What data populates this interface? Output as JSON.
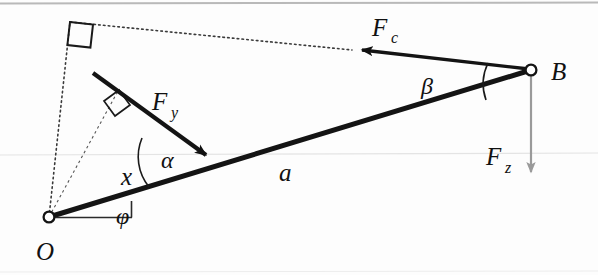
{
  "figure": {
    "background_color": "#fdfdfd",
    "stroke_color": "#111111",
    "gray_color": "#8c8c8c",
    "scan_line_color": "#bcbcbc"
  },
  "points": {
    "origin": {
      "label": "O",
      "x": 49,
      "y": 217
    },
    "end": {
      "label": "B",
      "x": 531,
      "y": 70
    },
    "right_angle_vertex": {
      "x": 70,
      "y": 22
    }
  },
  "labels": {
    "force_c": {
      "base": "F",
      "sub": "c",
      "x": 372,
      "y": 36
    },
    "force_y": {
      "base": "F",
      "sub": "y",
      "x": 152,
      "y": 110
    },
    "force_z": {
      "base": "F",
      "sub": "z",
      "x": 486,
      "y": 165
    },
    "point_o": {
      "text": "O",
      "x": 36,
      "y": 258
    },
    "point_b": {
      "text": "B",
      "x": 551,
      "y": 80
    },
    "length_a": {
      "text": "a",
      "x": 279,
      "y": 180
    },
    "length_x": {
      "text": "x",
      "x": 121,
      "y": 184
    },
    "angle_alpha": {
      "text": "α",
      "x": 163,
      "y": 166
    },
    "angle_beta": {
      "text": "β",
      "x": 424,
      "y": 92
    },
    "angle_phi": {
      "text": "φ",
      "x": 117,
      "y": 222
    }
  },
  "elements": {
    "beam": {
      "name": "beam-OB",
      "from": "O",
      "to": "B",
      "style": "solid-thick"
    },
    "force_c_arrow": {
      "name": "force-c-arrow",
      "from_x": 531,
      "from_y": 70,
      "to_x": 358,
      "to_y": 50,
      "style": "solid-thick-arrow"
    },
    "force_y_arrow": {
      "name": "force-y-arrow",
      "from_x": 93,
      "from_y": 73,
      "to_x": 212,
      "to_y": 160,
      "style": "solid-thick-arrow"
    },
    "force_z_arrow": {
      "name": "force-z-arrow",
      "from_x": 531,
      "from_y": 74,
      "to_x": 531,
      "to_y": 180,
      "style": "gray-thin-arrow"
    },
    "dotted_upper_left": {
      "name": "dotted-line-O-to-vertex",
      "from_x": 49,
      "from_y": 217,
      "to_x": 70,
      "to_y": 22,
      "style": "dotted"
    },
    "dotted_upper_right": {
      "name": "dotted-line-vertex-to-force-c",
      "from_x": 70,
      "from_y": 22,
      "to_x": 352,
      "to_y": 50,
      "style": "dotted"
    },
    "dashed_moment_arm": {
      "name": "dashed-moment-arm-x",
      "from_x": 49,
      "from_y": 217,
      "to_x": 117,
      "to_y": 92,
      "style": "dashed"
    },
    "horizontal_reference": {
      "name": "horizontal-reference-line",
      "from_x": 55,
      "from_y": 217,
      "to_x": 132,
      "to_y": 217,
      "style": "thin-solid"
    },
    "right_angle_top": {
      "name": "right-angle-marker-top",
      "x": 70,
      "y": 22
    },
    "right_angle_arm": {
      "name": "right-angle-marker-moment-arm",
      "x": 117,
      "y": 92
    },
    "arc_alpha": {
      "name": "angle-arc-alpha"
    },
    "arc_beta": {
      "name": "angle-arc-beta"
    },
    "arc_phi": {
      "name": "angle-tick-phi"
    }
  }
}
